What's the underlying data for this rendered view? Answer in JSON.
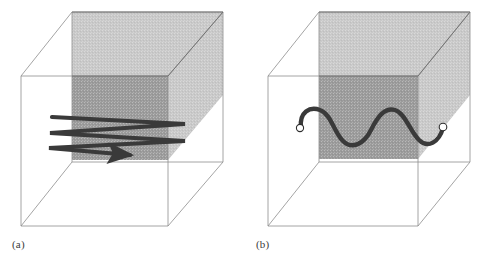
{
  "figure": {
    "background_color": "#ffffff",
    "width": 480,
    "height": 264
  },
  "colors": {
    "cube_edge": "#8d8d8d",
    "cube_edge_dark": "#6f6f6f",
    "plane_light_gray": "#c9c9c9",
    "plane_dark_gray": "#9b9b9b",
    "path_stroke": "#3a3a3a",
    "endpoint_fill": "#ffffff",
    "endpoint_stroke": "#2e2e2e",
    "label_text": "#3b3b3b"
  },
  "panels": [
    {
      "id": "a",
      "label": "(a)",
      "caption_label": "(a)",
      "path_type": "zigzag-raster-scan",
      "path_description": "Serpentine back-and-forth sweep of three passes terminating in a rightward arrowhead",
      "has_arrowhead": true,
      "arrowhead_direction": "right",
      "pass_count": 3,
      "cube": {
        "front_left_x": 21,
        "front_right_x": 168,
        "front_top_y": 76,
        "front_bottom_y": 226,
        "back_offset_x": 51,
        "back_offset_y": -64
      },
      "planes": {
        "light_gray_region": "upper back slab",
        "dark_gray_region": "front-facing mid slab"
      }
    },
    {
      "id": "b",
      "label": "(b)",
      "caption_label": "(b)",
      "path_type": "smooth-sinusoid",
      "path_description": "Smooth sinusoidal curve with two open circular endpoints",
      "has_arrowhead": false,
      "wave_cycles": 2,
      "endpoints": [
        {
          "name": "left-endpoint",
          "x": 300,
          "y": 128
        },
        {
          "name": "right-endpoint",
          "x": 443,
          "y": 127
        }
      ],
      "cube": {
        "front_left_x": 268,
        "front_right_x": 418,
        "front_top_y": 76,
        "front_bottom_y": 226,
        "back_offset_x": 51,
        "back_offset_y": -64
      },
      "planes": {
        "light_gray_region": "upper back slab",
        "dark_gray_region": "front-facing mid slab"
      }
    }
  ]
}
